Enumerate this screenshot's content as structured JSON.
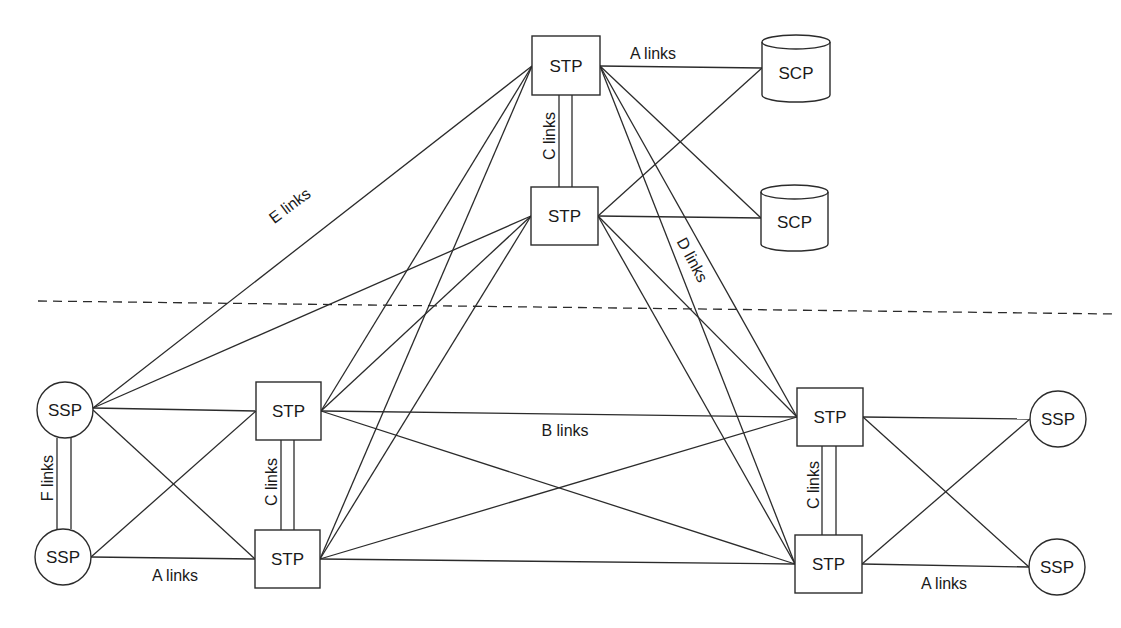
{
  "diagram": {
    "colors": {
      "stroke": "#2b2b2b",
      "text": "#1a1a1a",
      "background": "#ffffff"
    },
    "divider": {
      "x1": 38,
      "y1": 301,
      "x2": 1115,
      "y2": 314,
      "style": "dashed"
    },
    "nodes": [
      {
        "id": "stp_top1",
        "type": "STP",
        "label": "STP",
        "shape": "box",
        "x": 532,
        "y": 36,
        "w": 68,
        "h": 59
      },
      {
        "id": "stp_top2",
        "type": "STP",
        "label": "STP",
        "shape": "box",
        "x": 531,
        "y": 187,
        "w": 67,
        "h": 58
      },
      {
        "id": "scp1",
        "type": "SCP",
        "label": "SCP",
        "shape": "cylinder",
        "x": 762,
        "y": 35,
        "w": 68,
        "h": 67
      },
      {
        "id": "scp2",
        "type": "SCP",
        "label": "SCP",
        "shape": "cylinder",
        "x": 761,
        "y": 185,
        "w": 67,
        "h": 66
      },
      {
        "id": "ssp_l1",
        "type": "SSP",
        "label": "SSP",
        "shape": "circle",
        "cx": 65,
        "cy": 410,
        "r": 28
      },
      {
        "id": "ssp_l2",
        "type": "SSP",
        "label": "SSP",
        "shape": "circle",
        "cx": 63,
        "cy": 557,
        "r": 28
      },
      {
        "id": "stp_l1",
        "type": "STP",
        "label": "STP",
        "shape": "box",
        "x": 256,
        "y": 382,
        "w": 65,
        "h": 58
      },
      {
        "id": "stp_l2",
        "type": "STP",
        "label": "STP",
        "shape": "box",
        "x": 255,
        "y": 530,
        "w": 65,
        "h": 58
      },
      {
        "id": "stp_r1",
        "type": "STP",
        "label": "STP",
        "shape": "box",
        "x": 797,
        "y": 388,
        "w": 66,
        "h": 58
      },
      {
        "id": "stp_r2",
        "type": "STP",
        "label": "STP",
        "shape": "box",
        "x": 795,
        "y": 535,
        "w": 67,
        "h": 58
      },
      {
        "id": "ssp_r1",
        "type": "SSP",
        "label": "SSP",
        "shape": "circle",
        "cx": 1058,
        "cy": 419,
        "r": 28
      },
      {
        "id": "ssp_r2",
        "type": "SSP",
        "label": "SSP",
        "shape": "circle",
        "cx": 1057,
        "cy": 567,
        "r": 28
      }
    ],
    "links": [
      {
        "type": "A",
        "x1": 600,
        "y1": 66,
        "x2": 762,
        "y2": 68
      },
      {
        "type": "A",
        "x1": 600,
        "y1": 66,
        "x2": 761,
        "y2": 218
      },
      {
        "type": "A",
        "x1": 598,
        "y1": 216,
        "x2": 762,
        "y2": 68
      },
      {
        "type": "A",
        "x1": 598,
        "y1": 216,
        "x2": 761,
        "y2": 218
      },
      {
        "type": "E",
        "x1": 93,
        "y1": 408,
        "x2": 532,
        "y2": 66
      },
      {
        "type": "E",
        "x1": 93,
        "y1": 408,
        "x2": 531,
        "y2": 216
      },
      {
        "type": "D",
        "x1": 532,
        "y1": 66,
        "x2": 321,
        "y2": 411
      },
      {
        "type": "D",
        "x1": 532,
        "y1": 66,
        "x2": 320,
        "y2": 559
      },
      {
        "type": "D",
        "x1": 531,
        "y1": 216,
        "x2": 321,
        "y2": 411
      },
      {
        "type": "D",
        "x1": 531,
        "y1": 216,
        "x2": 320,
        "y2": 559
      },
      {
        "type": "D",
        "x1": 600,
        "y1": 66,
        "x2": 797,
        "y2": 417
      },
      {
        "type": "D",
        "x1": 600,
        "y1": 66,
        "x2": 795,
        "y2": 564
      },
      {
        "type": "D",
        "x1": 598,
        "y1": 216,
        "x2": 797,
        "y2": 417
      },
      {
        "type": "D",
        "x1": 598,
        "y1": 216,
        "x2": 795,
        "y2": 564
      },
      {
        "type": "A",
        "x1": 93,
        "y1": 408,
        "x2": 256,
        "y2": 411
      },
      {
        "type": "A",
        "x1": 93,
        "y1": 410,
        "x2": 255,
        "y2": 559
      },
      {
        "type": "A",
        "x1": 91,
        "y1": 557,
        "x2": 256,
        "y2": 411
      },
      {
        "type": "A",
        "x1": 91,
        "y1": 557,
        "x2": 255,
        "y2": 559
      },
      {
        "type": "B",
        "x1": 321,
        "y1": 411,
        "x2": 797,
        "y2": 417
      },
      {
        "type": "B",
        "x1": 321,
        "y1": 411,
        "x2": 795,
        "y2": 564
      },
      {
        "type": "B",
        "x1": 320,
        "y1": 559,
        "x2": 797,
        "y2": 417
      },
      {
        "type": "B",
        "x1": 320,
        "y1": 559,
        "x2": 795,
        "y2": 564
      },
      {
        "type": "A",
        "x1": 863,
        "y1": 417,
        "x2": 1030,
        "y2": 419
      },
      {
        "type": "A",
        "x1": 863,
        "y1": 417,
        "x2": 1029,
        "y2": 567
      },
      {
        "type": "A",
        "x1": 862,
        "y1": 564,
        "x2": 1030,
        "y2": 419
      },
      {
        "type": "A",
        "x1": 862,
        "y1": 564,
        "x2": 1029,
        "y2": 567
      }
    ],
    "double_links": [
      {
        "type": "C",
        "xa": 559,
        "xb": 572,
        "y1": 95,
        "y2": 187
      },
      {
        "type": "F",
        "xa": 57,
        "xb": 71,
        "y1": 438,
        "y2": 529
      },
      {
        "type": "C",
        "xa": 281,
        "xb": 294,
        "y1": 440,
        "y2": 530
      },
      {
        "type": "C",
        "xa": 822,
        "xb": 836,
        "y1": 446,
        "y2": 535
      }
    ],
    "labels": [
      {
        "id": "lbl_a_top",
        "text": "A links",
        "x": 653,
        "y": 59,
        "rotate": 0
      },
      {
        "id": "lbl_c_top",
        "text": "C links",
        "x": 550,
        "y": 141,
        "rotate": -90
      },
      {
        "id": "lbl_e",
        "text": "E links",
        "x": 290,
        "y": 211,
        "rotate": -37
      },
      {
        "id": "lbl_d",
        "text": "D links",
        "x": 692,
        "y": 265,
        "rotate": 62
      },
      {
        "id": "lbl_f",
        "text": "F links",
        "x": 48,
        "y": 483,
        "rotate": -90
      },
      {
        "id": "lbl_c_left",
        "text": "C links",
        "x": 272,
        "y": 487,
        "rotate": -90
      },
      {
        "id": "lbl_a_left",
        "text": "A links",
        "x": 175,
        "y": 581,
        "rotate": 0
      },
      {
        "id": "lbl_b",
        "text": "B links",
        "x": 565,
        "y": 436,
        "rotate": 0
      },
      {
        "id": "lbl_c_right",
        "text": "C links",
        "x": 814,
        "y": 490,
        "rotate": -90
      },
      {
        "id": "lbl_a_right",
        "text": "A links",
        "x": 944,
        "y": 589,
        "rotate": 0
      }
    ]
  }
}
